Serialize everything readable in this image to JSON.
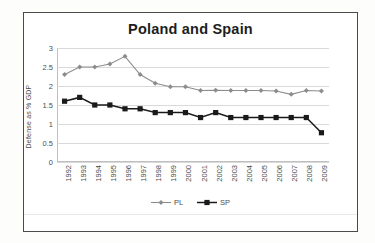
{
  "chart_data": {
    "type": "line",
    "title": "Poland and Spain",
    "xlabel": "",
    "ylabel": "Defense as % GDP",
    "ylim": [
      0,
      3
    ],
    "yticks": [
      "0",
      "0.5",
      "1",
      "1.5",
      "2",
      "2.5",
      "3"
    ],
    "ytick_values": [
      0,
      0.5,
      1,
      1.5,
      2,
      2.5,
      3
    ],
    "grid": true,
    "legend_position": "bottom",
    "categories": [
      "1992",
      "1993",
      "1994",
      "1995",
      "1996",
      "1997",
      "1998",
      "1999",
      "2000",
      "2001",
      "2002",
      "2003",
      "2004",
      "2005",
      "2006",
      "2007",
      "2008",
      "2009"
    ],
    "series": [
      {
        "name": "PL",
        "marker": "diamond",
        "color": "#8c8c8c",
        "values": [
          2.3,
          2.5,
          2.5,
          2.58,
          2.78,
          2.3,
          2.07,
          1.98,
          1.98,
          1.88,
          1.89,
          1.88,
          1.88,
          1.88,
          1.87,
          1.78,
          1.88,
          1.87
        ]
      },
      {
        "name": "SP",
        "marker": "square",
        "color": "#1a1a1a",
        "values": [
          1.6,
          1.7,
          1.5,
          1.5,
          1.4,
          1.4,
          1.3,
          1.3,
          1.3,
          1.17,
          1.3,
          1.17,
          1.17,
          1.17,
          1.17,
          1.17,
          1.17,
          0.77
        ]
      }
    ]
  },
  "colors": {
    "frame": "#4a4a4a",
    "gridline": "#d9d9d9",
    "axis": "#bfbfbf",
    "text": "#4d4d4d",
    "title": "#1d1d1d",
    "series_pl": "#8c8c8c",
    "series_sp": "#1a1a1a"
  }
}
